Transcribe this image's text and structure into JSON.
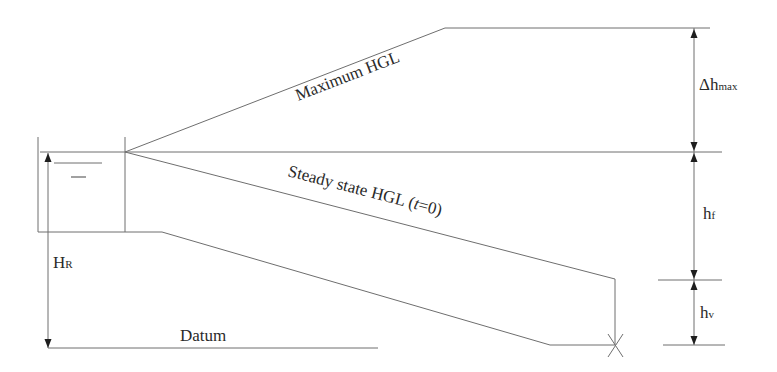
{
  "diagram": {
    "type": "hydraulic-grade-line-schematic",
    "labels": {
      "maximum_hgl": "Maximum HGL",
      "steady_state_hgl": "Steady state HGL (",
      "steady_state_t": "t",
      "steady_state_tail": "=0)",
      "delta_h_max_main": "Δh",
      "delta_h_max_sub": "max",
      "hf_main": "h",
      "hf_sub": "f",
      "hv_main": "h",
      "hv_sub": "v",
      "hr_main": "H",
      "hr_sub": "R",
      "datum": "Datum"
    },
    "colors": {
      "line": "#6e6e6e",
      "text": "#2a2a2a",
      "arrowhead": "#1e1e1e",
      "background": "#ffffff"
    }
  }
}
